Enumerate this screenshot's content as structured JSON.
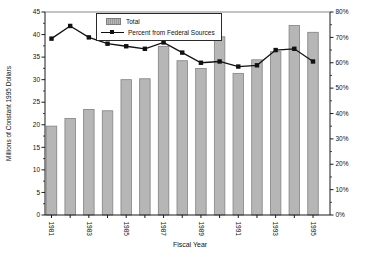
{
  "figure": {
    "background": "#ffffff",
    "colors": {
      "bar_fill": "#b6b6b6",
      "bar_border": "#828282",
      "line": "#111111",
      "axis": "#1a1a1a",
      "text": "#111111",
      "plot_top_border": "#c4c4c4"
    },
    "legend": {
      "position": "top-center",
      "items": [
        {
          "label": "Total",
          "swatch": "gray-bar-swatch"
        },
        {
          "label": "Percent from Federal Sources",
          "swatch": "line-marker-swatch"
        }
      ]
    }
  },
  "chart_data": {
    "type": "bar",
    "title": "",
    "xlabel": "Fiscal Year",
    "ylabel": "Millions of Constant 1995 Dollars",
    "ylabel_right": "Percent from Federal Sources",
    "grid": false,
    "legend_position": "top-center",
    "categories": [
      "1981",
      "1982",
      "1983",
      "1984",
      "1985",
      "1986",
      "1987",
      "1988",
      "1989",
      "1990",
      "1991",
      "1992",
      "1993",
      "1994",
      "1995"
    ],
    "series": [
      {
        "name": "Total",
        "type": "bar",
        "axis": "left",
        "values": [
          19.7,
          21.4,
          23.4,
          23.1,
          30.0,
          30.2,
          37.4,
          34.2,
          32.5,
          39.5,
          31.4,
          34.4,
          36.2,
          42.0,
          40.5
        ]
      },
      {
        "name": "Percent from Federal Sources",
        "type": "line",
        "axis": "right",
        "values": [
          69.5,
          74.5,
          70.0,
          67.5,
          66.5,
          65.5,
          68.0,
          64.0,
          60.0,
          60.5,
          58.5,
          59.0,
          65.0,
          65.5,
          60.5
        ]
      }
    ],
    "left_axis": {
      "min": 0,
      "max": 45,
      "tick_step": 5,
      "minor_step": 2.5,
      "tick_labels": [
        "0",
        "5",
        "10",
        "15",
        "20",
        "25",
        "30",
        "35",
        "40",
        "45"
      ]
    },
    "right_axis": {
      "min": 0,
      "max": 80,
      "tick_step": 10,
      "minor_step": 5,
      "tick_labels": [
        "0%",
        "10%",
        "20%",
        "30%",
        "40%",
        "50%",
        "60%",
        "70%",
        "80%"
      ]
    },
    "x_axis": {
      "title": "Fiscal Year",
      "labeled_categories": [
        "1981",
        "1983",
        "1985",
        "1987",
        "1989",
        "1991",
        "1993",
        "1995"
      ]
    }
  }
}
